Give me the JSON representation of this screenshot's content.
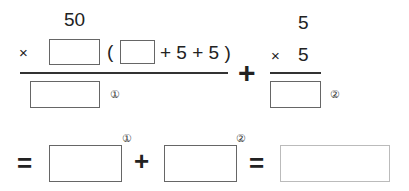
{
  "problem": {
    "left": {
      "top_number": "50",
      "times_sign": "×",
      "open_paren": "(",
      "expression_tail": "+ 5 + 5 )",
      "result_marker": "①"
    },
    "plus_sign": "+",
    "right": {
      "top_number": "5",
      "times_sign": "×",
      "multiplier": "5",
      "result_marker": "②"
    }
  },
  "summary": {
    "equals_1": "=",
    "marker_1": "①",
    "plus": "+",
    "marker_2": "②",
    "equals_2": "="
  },
  "inputs": {
    "left_multiplier": "",
    "paren_first_term": "",
    "left_result": "",
    "right_result": "",
    "sum_term_1": "",
    "sum_term_2": "",
    "final_answer": ""
  }
}
